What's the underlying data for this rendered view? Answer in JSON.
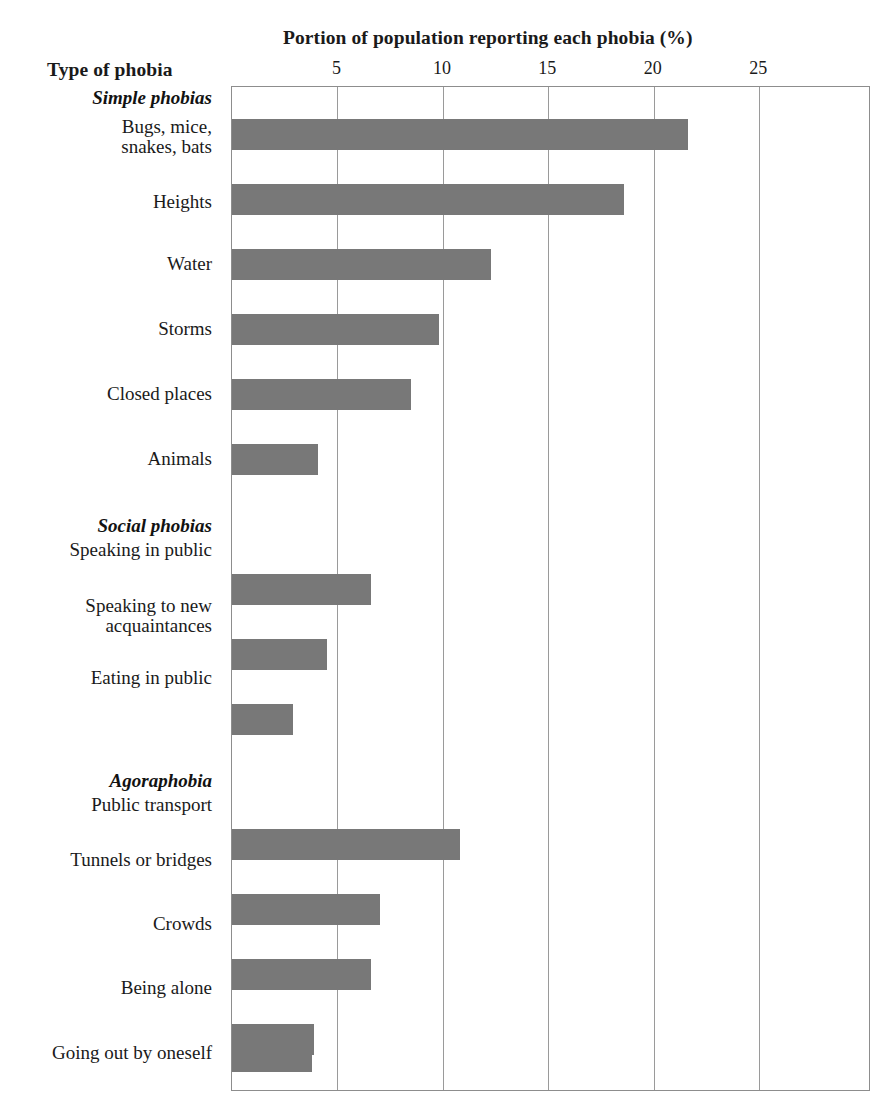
{
  "chart_data": {
    "type": "bar",
    "orientation": "horizontal",
    "title": "Portion of population reporting each phobia (%)",
    "xlabel": "Portion of population reporting each phobia (%)",
    "ylabel": "Type of phobia",
    "xlim": [
      0,
      30.3
    ],
    "xticks": [
      5,
      10,
      15,
      20,
      25
    ],
    "xtick_labels": [
      "5",
      "10",
      "15",
      "20",
      "25"
    ],
    "grid": "vertical",
    "legend": "none",
    "bar_color": "#787878",
    "frame_color": "#8d8d8d",
    "groups": [
      {
        "name": "Simple phobias",
        "categories": [
          "Bugs, mice,\nsnakes, bats",
          "Heights",
          "Water",
          "Storms",
          "Closed places",
          "Animals"
        ],
        "values": [
          21.6,
          18.6,
          12.3,
          9.8,
          8.5,
          4.1
        ]
      },
      {
        "name": "Social phobias",
        "categories": [
          "Speaking in public",
          "Speaking to new\nacquaintances",
          "Eating in public"
        ],
        "values": [
          6.6,
          4.5,
          2.9
        ]
      },
      {
        "name": "Agoraphobia",
        "categories": [
          "Public transport",
          "Tunnels or bridges",
          "Crowds",
          "Being alone",
          "Going out by oneself"
        ],
        "values": [
          10.8,
          7.0,
          6.6,
          3.9,
          3.8
        ]
      }
    ],
    "categories": [
      "Bugs, mice,\nsnakes, bats",
      "Heights",
      "Water",
      "Storms",
      "Closed places",
      "Animals",
      "Speaking in public",
      "Speaking to new\nacquaintances",
      "Eating in public",
      "Public transport",
      "Tunnels or bridges",
      "Crowds",
      "Being alone",
      "Going out by oneself"
    ],
    "values": [
      21.6,
      18.6,
      12.3,
      9.8,
      8.5,
      4.1,
      6.6,
      4.5,
      2.9,
      10.8,
      7.0,
      6.6,
      3.9,
      3.8
    ]
  },
  "header": {
    "chart_title": "Portion of population reporting each phobia (%)",
    "y_axis_title": "Type of phobia"
  },
  "axis": {
    "ticks": [
      {
        "value": 5,
        "label": "5"
      },
      {
        "value": 10,
        "label": "10"
      },
      {
        "value": 15,
        "label": "15"
      },
      {
        "value": 20,
        "label": "20"
      },
      {
        "value": 25,
        "label": "25"
      }
    ]
  },
  "rows": [
    {
      "kind": "group",
      "label": "Simple phobias",
      "y": 88
    },
    {
      "kind": "bar",
      "label": "Bugs, mice,\nsnakes, bats",
      "value": 21.6,
      "y": 118,
      "label_y": 117
    },
    {
      "kind": "bar",
      "label": "Heights",
      "value": 18.6,
      "y": 183,
      "label_y": 192
    },
    {
      "kind": "bar",
      "label": "Water",
      "value": 12.3,
      "y": 248,
      "label_y": 254
    },
    {
      "kind": "bar",
      "label": "Storms",
      "value": 9.8,
      "y": 313,
      "label_y": 319
    },
    {
      "kind": "bar",
      "label": "Closed places",
      "value": 8.5,
      "y": 378,
      "label_y": 384
    },
    {
      "kind": "bar",
      "label": "Animals",
      "value": 4.1,
      "y": 443,
      "label_y": 449
    },
    {
      "kind": "group",
      "label": "Social phobias",
      "y": 516
    },
    {
      "kind": "bar",
      "label": "Speaking in public",
      "value": 6.6,
      "y": 573,
      "label_y": 540
    },
    {
      "kind": "bar",
      "label": "Speaking to new\nacquaintances",
      "value": 4.5,
      "y": 638,
      "label_y": 596
    },
    {
      "kind": "bar",
      "label": "Eating in public",
      "value": 2.9,
      "y": 703,
      "label_y": 668
    },
    {
      "kind": "group",
      "label": "Agoraphobia",
      "y": 771
    },
    {
      "kind": "bar",
      "label": "Public transport",
      "value": 10.8,
      "y": 828,
      "label_y": 795
    },
    {
      "kind": "bar",
      "label": "Tunnels or bridges",
      "value": 7.0,
      "y": 893,
      "label_y": 850
    },
    {
      "kind": "bar",
      "label": "Crowds",
      "value": 6.6,
      "y": 958,
      "label_y": 914
    },
    {
      "kind": "bar",
      "label": "Being alone",
      "value": 3.9,
      "y": 1023,
      "label_y": 978
    },
    {
      "kind": "bar",
      "label": "Going out by oneself",
      "value": 3.8,
      "y": 1040,
      "label_y": 1043
    }
  ]
}
